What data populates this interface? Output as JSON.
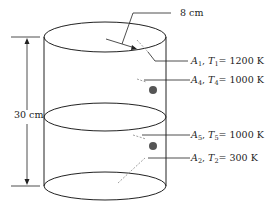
{
  "diagram": {
    "radius_label": "8 cm",
    "height_label": "30 cm",
    "surfaces": [
      {
        "id": "A1",
        "name": "A",
        "sub": "1",
        "tname": "T",
        "tsub": "1",
        "value": "= 1200 K"
      },
      {
        "id": "A4",
        "name": "A",
        "sub": "4",
        "tname": "T",
        "tsub": "4",
        "value": "= 1000 K"
      },
      {
        "id": "A5",
        "name": "A",
        "sub": "5",
        "tname": "T",
        "tsub": "5",
        "value": "= 1000 K"
      },
      {
        "id": "A2",
        "name": "A",
        "sub": "2",
        "tname": "T",
        "tsub": "2",
        "value": "= 300 K"
      }
    ],
    "colors": {
      "line": "#222222",
      "dash": "#888888",
      "dot": "#555555"
    }
  }
}
